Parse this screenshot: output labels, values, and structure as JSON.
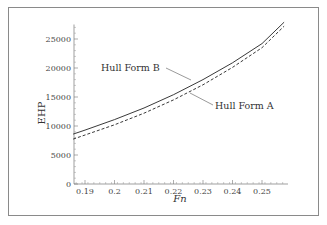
{
  "chart_data": {
    "type": "line",
    "title": "",
    "xlabel": "Fn",
    "ylabel": "EHP",
    "xlim": [
      0.186,
      0.2575
    ],
    "ylim": [
      0,
      27500
    ],
    "xticks": [
      "0.19",
      "0.2",
      "0.21",
      "0.22",
      "0.23",
      "0.24",
      "0.25"
    ],
    "yticks": [
      "0",
      "5000",
      "10000",
      "15000",
      "20000",
      "25000"
    ],
    "grid": false,
    "legend_position": "annotations",
    "x": [
      0.186,
      0.19,
      0.2,
      0.21,
      0.22,
      0.23,
      0.24,
      0.25,
      0.2575
    ],
    "series": [
      {
        "name": "Hull Form B",
        "style": "solid",
        "values": [
          8600,
          9300,
          11100,
          13100,
          15400,
          18000,
          20900,
          24200,
          27900
        ]
      },
      {
        "name": "Hull Form A",
        "style": "dashed",
        "values": [
          7750,
          8450,
          10200,
          12200,
          14500,
          17100,
          20100,
          23500,
          27200
        ]
      }
    ],
    "annotations": [
      {
        "text": "Hull Form B",
        "arrow_to_series": "Hull Form B"
      },
      {
        "text": "Hull Form A",
        "arrow_to_series": "Hull Form A"
      }
    ]
  },
  "labels": {
    "xlabel": "Fn",
    "ylabel": "EHP",
    "legend_b": "Hull Form B",
    "legend_a": "Hull Form A"
  }
}
